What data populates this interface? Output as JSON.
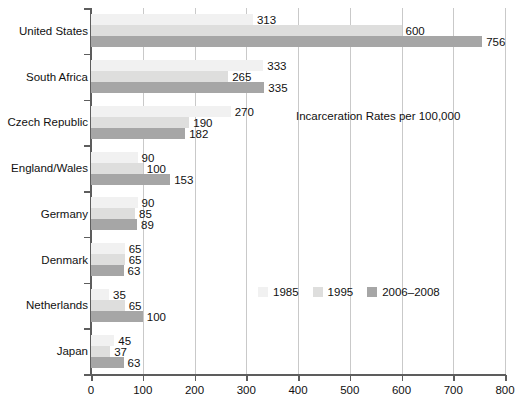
{
  "chart_data": {
    "type": "bar",
    "orientation": "horizontal",
    "title": "Incarceration Rates per 100,000",
    "xlabel": "",
    "ylabel": "",
    "xlim": [
      0,
      800
    ],
    "xticks": [
      0,
      100,
      200,
      300,
      400,
      500,
      600,
      700,
      800
    ],
    "grid": "vertical",
    "legend_position": "middle-right-inside",
    "categories": [
      "United States",
      "South Africa",
      "Czech Republic",
      "England/Wales",
      "Germany",
      "Denmark",
      "Netherlands",
      "Japan"
    ],
    "series": [
      {
        "name": "1985",
        "color": "#f1f1f1",
        "values": [
          313,
          333,
          270,
          90,
          90,
          65,
          35,
          45
        ]
      },
      {
        "name": "1995",
        "color": "#dededd",
        "values": [
          600,
          265,
          190,
          100,
          85,
          65,
          65,
          37
        ]
      },
      {
        "name": "2006–2008",
        "color": "#a6a6a6",
        "values": [
          756,
          335,
          182,
          153,
          89,
          63,
          100,
          63
        ]
      }
    ]
  },
  "colors": {
    "series_1985": "#f1f1f1",
    "series_1995": "#dededd",
    "series_2006_2008": "#a6a6a6",
    "axis": "#5d5d5d",
    "gridline": "#c9c9c9",
    "text": "#111111",
    "background": "#ffffff"
  }
}
